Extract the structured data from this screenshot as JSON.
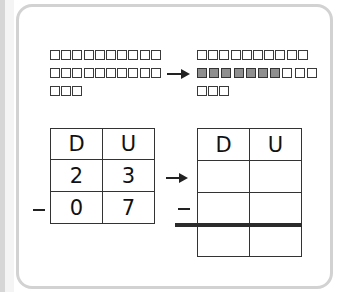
{
  "diagram": {
    "type": "subtraction-with-regrouping",
    "colors": {
      "frame_border": "#d2d2d2",
      "block_border": "#3a3a3a",
      "block_shaded": "#8f8f8f",
      "line": "#222222"
    },
    "before": {
      "blocks": {
        "rows": [
          {
            "count": 10,
            "shaded": 0
          },
          {
            "count": 10,
            "shaded": 0
          },
          {
            "count": 3,
            "shaded": 0
          }
        ]
      },
      "table": {
        "headers": [
          "D",
          "U"
        ],
        "rows": [
          {
            "operator": "",
            "cells": [
              "2",
              "3"
            ]
          },
          {
            "operator": "–",
            "cells": [
              "0",
              "7"
            ]
          }
        ]
      }
    },
    "after": {
      "blocks": {
        "rows": [
          {
            "count": 10,
            "shaded": 0
          },
          {
            "count": 10,
            "shaded": 7
          },
          {
            "count": 3,
            "shaded": 0
          }
        ]
      },
      "table": {
        "headers": [
          "D",
          "U"
        ],
        "rows": [
          {
            "operator": "",
            "cells": [
              "",
              ""
            ]
          },
          {
            "operator": "–",
            "cells": [
              "",
              ""
            ]
          },
          {
            "operator": "",
            "cells": [
              "",
              ""
            ]
          }
        ]
      }
    },
    "arrow_symbol": "→",
    "minus_symbol": "–"
  }
}
